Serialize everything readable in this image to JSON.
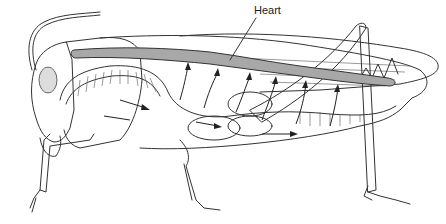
{
  "diagram": {
    "labels": [
      {
        "id": "heart",
        "text": "Heart",
        "x": 254,
        "y": 4
      }
    ],
    "colors": {
      "heart_fill": "#a8a8a8",
      "outline": "#333333",
      "background": "#ffffff"
    },
    "flow_arrows": {
      "count_up_into_heart": 6,
      "count_horizontal": 4
    }
  }
}
